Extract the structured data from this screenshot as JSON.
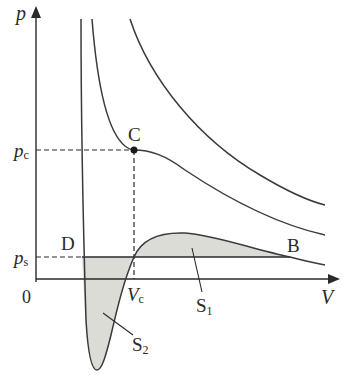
{
  "diagram": {
    "type": "pV isotherm diagram (van der Waals)",
    "axes": {
      "y_label": "p",
      "x_label": "V",
      "origin_label": "0"
    },
    "ticks": {
      "p_c": {
        "base": "p",
        "sub": "c"
      },
      "p_s": {
        "base": "p",
        "sub": "s"
      },
      "V_c": {
        "base": "V",
        "sub": "c"
      }
    },
    "points": {
      "C": "C",
      "D": "D",
      "B": "B"
    },
    "areas": {
      "S1": {
        "base": "S",
        "sub": "1"
      },
      "S2": {
        "base": "S",
        "sub": "2"
      }
    },
    "colors": {
      "line": "#3a3a3a",
      "shade": "#dcdcd6",
      "background": "#ffffff"
    }
  }
}
